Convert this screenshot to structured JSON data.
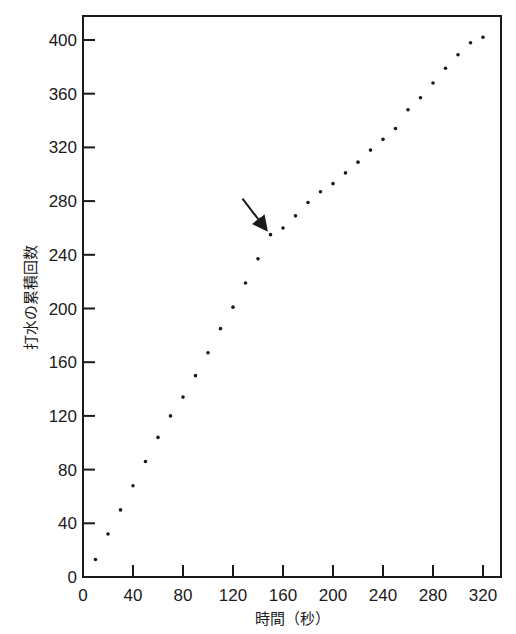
{
  "chart_data": {
    "type": "scatter",
    "title": "",
    "xlabel": "時間（秒）",
    "ylabel": "打水の累積回数",
    "xlim": [
      0,
      330
    ],
    "ylim": [
      0,
      420
    ],
    "xticks": [
      0,
      40,
      80,
      120,
      160,
      200,
      240,
      280,
      320
    ],
    "yticks": [
      0,
      40,
      80,
      120,
      160,
      200,
      240,
      280,
      320,
      360,
      400
    ],
    "grid": false,
    "legend": null,
    "series": [
      {
        "name": "cumulative strokes",
        "x": [
          10,
          20,
          30,
          40,
          50,
          60,
          70,
          80,
          90,
          100,
          110,
          120,
          130,
          140,
          150,
          160,
          170,
          180,
          190,
          200,
          210,
          220,
          230,
          240,
          250,
          260,
          270,
          280,
          290,
          300,
          310,
          320
        ],
        "y": [
          13,
          32,
          50,
          68,
          86,
          104,
          120,
          134,
          150,
          167,
          185,
          201,
          219,
          237,
          255,
          260,
          269,
          279,
          287,
          293,
          301,
          309,
          318,
          326,
          334,
          348,
          357,
          368,
          379,
          389,
          398,
          402
        ]
      }
    ],
    "annotations": [
      {
        "type": "arrow",
        "points_to": {
          "x": 150,
          "y": 255
        },
        "note": "slope change"
      }
    ]
  }
}
